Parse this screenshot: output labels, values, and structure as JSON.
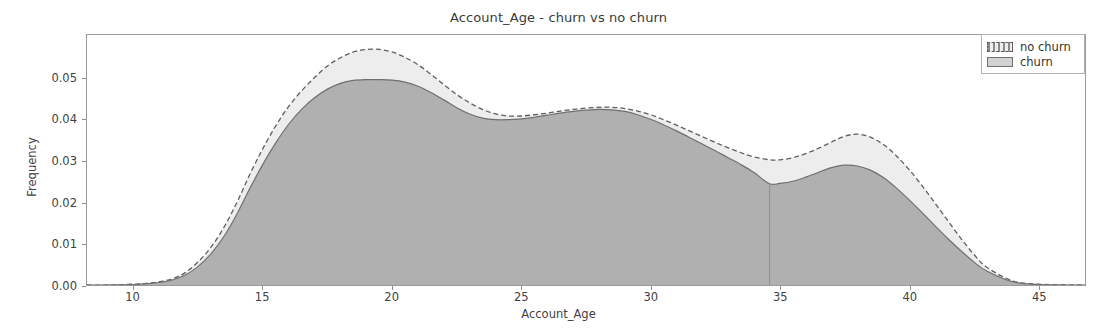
{
  "chart_data": {
    "type": "area",
    "title": "Account_Age - churn vs no churn",
    "xlabel": "Account_Age",
    "ylabel": "Frequency",
    "xlim": [
      8.2,
      46.8
    ],
    "ylim": [
      0.0,
      0.0605
    ],
    "xticks": [
      10,
      15,
      20,
      25,
      30,
      35,
      40,
      45
    ],
    "xtick_labels": [
      "10",
      "15",
      "20",
      "25",
      "30",
      "35",
      "40",
      "45"
    ],
    "yticks": [
      0.0,
      0.01,
      0.02,
      0.03,
      0.04,
      0.05
    ],
    "ytick_labels": [
      "0.00",
      "0.01",
      "0.02",
      "0.03",
      "0.04",
      "0.05"
    ],
    "grid": false,
    "legend_position": "upper right",
    "legend_entries": [
      "no churn",
      "churn"
    ],
    "annotations": [
      "vertical rug line at Account_Age = 34.6"
    ],
    "rug_line_x": 34.6,
    "x": [
      8.2,
      9.0,
      10.0,
      10.5,
      11.0,
      11.5,
      12.0,
      12.5,
      13.0,
      13.5,
      14.0,
      14.5,
      15.0,
      15.5,
      16.0,
      16.5,
      17.0,
      17.5,
      18.0,
      18.5,
      19.0,
      19.5,
      20.0,
      20.5,
      21.0,
      21.5,
      22.0,
      22.5,
      23.0,
      23.5,
      24.0,
      24.5,
      25.0,
      25.5,
      26.0,
      26.5,
      27.0,
      27.5,
      28.0,
      28.5,
      29.0,
      29.5,
      30.0,
      30.5,
      31.0,
      31.5,
      32.0,
      32.5,
      33.0,
      33.5,
      34.0,
      34.6,
      35.0,
      35.5,
      36.0,
      36.5,
      37.0,
      37.5,
      38.0,
      38.5,
      39.0,
      39.5,
      40.0,
      40.5,
      41.0,
      41.5,
      42.0,
      42.5,
      43.0,
      44.0,
      45.0,
      46.8
    ],
    "series": [
      {
        "name": "no churn",
        "style": "dashed-outline",
        "values": [
          0.0,
          0.0,
          0.0002,
          0.0004,
          0.0008,
          0.0015,
          0.003,
          0.0056,
          0.0092,
          0.014,
          0.02,
          0.0268,
          0.033,
          0.0385,
          0.0432,
          0.047,
          0.0502,
          0.053,
          0.055,
          0.0564,
          0.057,
          0.057,
          0.0564,
          0.0551,
          0.0533,
          0.051,
          0.0485,
          0.0461,
          0.0441,
          0.0425,
          0.0414,
          0.0409,
          0.0409,
          0.0412,
          0.0416,
          0.0421,
          0.0425,
          0.0428,
          0.043,
          0.043,
          0.0427,
          0.0421,
          0.0412,
          0.04,
          0.0387,
          0.0373,
          0.0359,
          0.0345,
          0.0332,
          0.032,
          0.031,
          0.0303,
          0.0303,
          0.0308,
          0.0318,
          0.0331,
          0.0346,
          0.036,
          0.0365,
          0.0358,
          0.034,
          0.0313,
          0.0279,
          0.024,
          0.0198,
          0.0155,
          0.0113,
          0.0074,
          0.0043,
          0.001,
          0.0002,
          0.0
        ]
      },
      {
        "name": "churn",
        "style": "solid-fill",
        "values": [
          0.0,
          0.0,
          0.0001,
          0.0003,
          0.0006,
          0.0012,
          0.0024,
          0.0045,
          0.0076,
          0.0118,
          0.0172,
          0.0234,
          0.0292,
          0.0344,
          0.0389,
          0.0425,
          0.0453,
          0.0474,
          0.0488,
          0.0495,
          0.0497,
          0.0497,
          0.0496,
          0.0491,
          0.0481,
          0.0466,
          0.0448,
          0.0429,
          0.0414,
          0.0404,
          0.04,
          0.04,
          0.0402,
          0.0406,
          0.0411,
          0.0416,
          0.042,
          0.0423,
          0.0425,
          0.0424,
          0.042,
          0.0412,
          0.0401,
          0.0388,
          0.0373,
          0.0357,
          0.0341,
          0.0325,
          0.0308,
          0.0291,
          0.0272,
          0.0245,
          0.0246,
          0.0251,
          0.0261,
          0.0273,
          0.0284,
          0.029,
          0.0288,
          0.0278,
          0.026,
          0.0235,
          0.0206,
          0.0175,
          0.0143,
          0.0112,
          0.0083,
          0.0056,
          0.0034,
          0.0008,
          0.0001,
          0.0
        ]
      }
    ],
    "colors": {
      "no_churn_fill": "#ededed",
      "no_churn_line": "#5e5e5e",
      "churn_fill": "#b0b0b0",
      "churn_line": "#6f6f6f",
      "axis": "#9a9a9a",
      "text": "#3f3f3f"
    }
  }
}
